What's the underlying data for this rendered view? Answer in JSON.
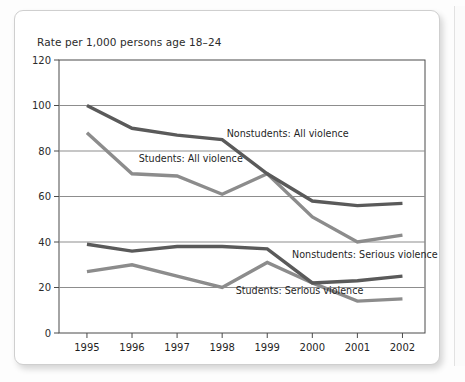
{
  "figure": {
    "title": "Rate per 1,000 persons age 18–24"
  },
  "chart_data": {
    "type": "line",
    "title": "Rate per 1,000 persons age 18–24",
    "xlabel": "",
    "ylabel": "Rate per 1,000 persons age 18–24",
    "categories": [
      "1995",
      "1996",
      "1997",
      "1998",
      "1999",
      "2000",
      "2001",
      "2002"
    ],
    "x": [
      1995,
      1996,
      1997,
      1998,
      1999,
      2000,
      2001,
      2002
    ],
    "ylim": [
      0,
      120
    ],
    "yticks": [
      0,
      20,
      40,
      60,
      80,
      100,
      120
    ],
    "grid": "horizontal",
    "legend_position": "inline-annotations",
    "series": [
      {
        "name": "Nonstudents: All violence",
        "color": "#5a5a5a",
        "values": [
          100,
          90,
          87,
          85,
          70,
          58,
          56,
          57
        ]
      },
      {
        "name": "Students: All violence",
        "color": "#8c8c8c",
        "values": [
          88,
          70,
          69,
          61,
          70,
          51,
          40,
          43
        ]
      },
      {
        "name": "Nonstudents: Serious violence",
        "color": "#5a5a5a",
        "values": [
          39,
          36,
          38,
          38,
          37,
          22,
          23,
          25
        ]
      },
      {
        "name": "Students: Serious violence",
        "color": "#8c8c8c",
        "values": [
          27,
          30,
          25,
          20,
          31,
          22,
          14,
          15
        ]
      }
    ],
    "annotations": [
      {
        "text": "Nonstudents: All violence",
        "x": 1998.1,
        "y": 86
      },
      {
        "text": "Students: All violence",
        "x": 1996.15,
        "y": 75
      },
      {
        "text": "Nonstudents: Serious violence",
        "x": 1999.55,
        "y": 33
      },
      {
        "text": "Students: Serious violence",
        "x": 1998.3,
        "y": 17
      }
    ]
  },
  "axis": {
    "y_tick_labels": [
      "120",
      "100",
      "80",
      "60",
      "40",
      "20",
      "0"
    ],
    "x_tick_labels": [
      "1995",
      "1996",
      "1997",
      "1998",
      "1999",
      "2000",
      "2001",
      "2002"
    ]
  },
  "colors": {
    "dark_series": "#5a5a5a",
    "light_series": "#8c8c8c",
    "grid": "#8d8d8d",
    "axis": "#4a4a4a",
    "card_background": "#ffffff"
  }
}
